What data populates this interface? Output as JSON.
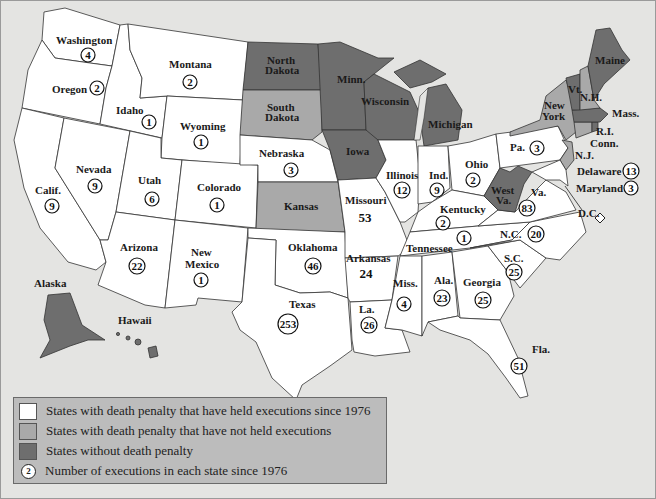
{
  "map": {
    "title": "Executions by state since 1976",
    "colors": {
      "executed": "#ffffff",
      "no_executions": "#a9a9a9",
      "no_death_penalty": "#6e6e6e",
      "water": "#e4e4e2"
    },
    "states": {
      "washington": {
        "label": "Washington",
        "executions": "4"
      },
      "oregon": {
        "label": "Oregon",
        "executions": "2"
      },
      "idaho": {
        "label": "Idaho",
        "executions": "1"
      },
      "montana": {
        "label": "Montana",
        "executions": "2"
      },
      "wyoming": {
        "label": "Wyoming",
        "executions": "1"
      },
      "california": {
        "label": "Calif.",
        "executions": "9"
      },
      "nevada": {
        "label": "Nevada",
        "executions": "9"
      },
      "utah": {
        "label": "Utah",
        "executions": "6"
      },
      "colorado": {
        "label": "Colorado",
        "executions": "1"
      },
      "arizona": {
        "label": "Arizona",
        "executions": "22"
      },
      "new_mexico": {
        "label1": "New",
        "label2": "Mexico",
        "executions": "1"
      },
      "north_dakota": {
        "label1": "North",
        "label2": "Dakota"
      },
      "south_dakota": {
        "label1": "South",
        "label2": "Dakota"
      },
      "nebraska": {
        "label": "Nebraska",
        "executions": "3"
      },
      "kansas": {
        "label": "Kansas"
      },
      "oklahoma": {
        "label": "Oklahoma",
        "executions": "46"
      },
      "texas": {
        "label": "Texas",
        "executions": "253"
      },
      "minnesota": {
        "label": "Minn."
      },
      "iowa": {
        "label": "Iowa"
      },
      "missouri": {
        "label": "Missouri",
        "executions": "53"
      },
      "arkansas": {
        "label": "Arkansas",
        "executions": "24"
      },
      "louisiana": {
        "label": "La.",
        "executions": "26"
      },
      "wisconsin": {
        "label": "Wisconsin"
      },
      "illinois": {
        "label": "Illinois",
        "executions": "12"
      },
      "michigan": {
        "label": "Michigan"
      },
      "indiana": {
        "label": "Ind.",
        "executions": "9"
      },
      "ohio": {
        "label": "Ohio",
        "executions": "2"
      },
      "kentucky": {
        "label": "Kentucky",
        "executions": "2"
      },
      "tennessee": {
        "label": "Tennessee",
        "executions": "1"
      },
      "mississippi": {
        "label": "Miss.",
        "executions": "4"
      },
      "alabama": {
        "label": "Ala.",
        "executions": "23"
      },
      "georgia": {
        "label": "Georgia",
        "executions": "25"
      },
      "florida": {
        "label": "Fla.",
        "executions": "51"
      },
      "south_carolina": {
        "label": "S.C.",
        "executions": "25"
      },
      "north_carolina": {
        "label": "N.C.",
        "executions": "20"
      },
      "virginia": {
        "label": "Va.",
        "executions": "83"
      },
      "west_virginia": {
        "label1": "West",
        "label2": "Va."
      },
      "pennsylvania": {
        "label": "Pa.",
        "executions": "3"
      },
      "new_york": {
        "label1": "New",
        "label2": "York"
      },
      "new_jersey": {
        "label": "N.J."
      },
      "connecticut": {
        "label": "Conn."
      },
      "rhode_island": {
        "label": "R.I."
      },
      "massachusetts": {
        "label": "Mass."
      },
      "vermont": {
        "label": "Vt."
      },
      "new_hampshire": {
        "label": "N.H."
      },
      "maine": {
        "label": "Maine"
      },
      "delaware": {
        "label": "Delaware",
        "executions": "13"
      },
      "maryland": {
        "label": "Maryland",
        "executions": "3"
      },
      "dc": {
        "label": "D.C."
      },
      "alaska": {
        "label": "Alaska"
      },
      "hawaii": {
        "label": "Hawaii"
      }
    }
  },
  "legend": {
    "items": [
      {
        "label": "States with death penalty that have held executions since 1976"
      },
      {
        "label": "States with death penalty that have not held executions"
      },
      {
        "label": "States without death penalty"
      },
      {
        "label": "Number of executions in each state since 1976",
        "sample": "2"
      }
    ]
  }
}
